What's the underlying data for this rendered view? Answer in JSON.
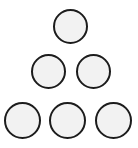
{
  "canvas": {
    "width": 138,
    "height": 148,
    "background_color": "#ffffff",
    "description": "Triangular pyramid arrangement of six outlined circles"
  },
  "style": {
    "fill_color": "#f2f2f2",
    "stroke_color": "#1c1c1c",
    "stroke_width": 2
  },
  "shapes": {
    "count": 6,
    "kind": "circle",
    "rows": [
      1,
      2,
      3
    ],
    "items": [
      {
        "id": "circle-1",
        "row": 1,
        "index_in_row": 1,
        "x": 53,
        "y": 9,
        "diameter": 35,
        "center_x": 70.5,
        "center_y": 26.5
      },
      {
        "id": "circle-2",
        "row": 2,
        "index_in_row": 1,
        "x": 31,
        "y": 54,
        "diameter": 35,
        "center_x": 48.5,
        "center_y": 71.5
      },
      {
        "id": "circle-3",
        "row": 2,
        "index_in_row": 2,
        "x": 76,
        "y": 54,
        "diameter": 35,
        "center_x": 93.5,
        "center_y": 71.5
      },
      {
        "id": "circle-4",
        "row": 3,
        "index_in_row": 1,
        "x": 4,
        "y": 102,
        "diameter": 37,
        "center_x": 22.5,
        "center_y": 120.5
      },
      {
        "id": "circle-5",
        "row": 3,
        "index_in_row": 2,
        "x": 49,
        "y": 102,
        "diameter": 37,
        "center_x": 67.5,
        "center_y": 120.5
      },
      {
        "id": "circle-6",
        "row": 3,
        "index_in_row": 3,
        "x": 95,
        "y": 102,
        "diameter": 37,
        "center_x": 113.5,
        "center_y": 120.5
      }
    ]
  }
}
